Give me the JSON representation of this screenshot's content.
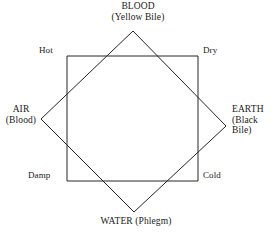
{
  "figure": {
    "stroke_color": "#262626",
    "stroke_width": 1,
    "background_color": "#ffffff"
  },
  "elements": {
    "top": {
      "name": "BLOOD",
      "humor": "(Yellow Bile)"
    },
    "right": {
      "name": "EARTH",
      "humor_line1": "(Black",
      "humor_line2": "Bile)"
    },
    "bottom": {
      "name": "WATER (Phlegm)"
    },
    "left": {
      "name": "AIR",
      "humor": "(Blood)"
    }
  },
  "qualities": {
    "top_left": "Hot",
    "top_right": "Dry",
    "bottom_left": "Damp",
    "bottom_right": "Cold"
  },
  "shapes": {
    "square": {
      "name": "qualities-square",
      "points": "67,56 198,56 198,181 67,181"
    },
    "diamond": {
      "name": "elements-diamond",
      "points": "133,31 226,126 134,212 41,119"
    }
  }
}
